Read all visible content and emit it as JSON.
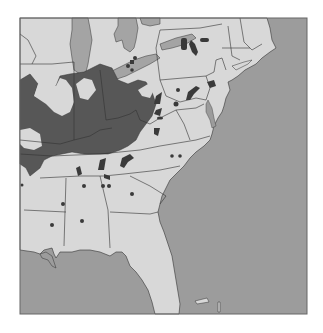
{
  "map": {
    "title": "",
    "region": "Eastern United States",
    "colors": {
      "land": "#d8d8d8",
      "water": "#9c9c9c",
      "lakes": "#a4a4a4",
      "highlighted_region": "#575757",
      "deposits": "#3a3a3a",
      "borders": "#333333",
      "frame": "#666666"
    },
    "legend": []
  }
}
